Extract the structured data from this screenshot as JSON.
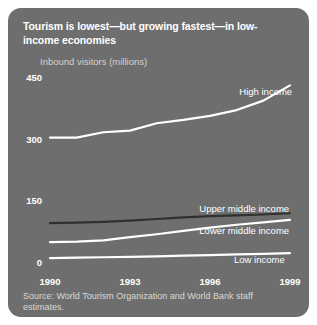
{
  "figure": {
    "title": "Tourism is lowest—but growing fastest—in low-income economies",
    "source": "Source: World Tourism Organization and World Bank staff estimates.",
    "panel_color": "#6e6e6e",
    "page_color": "#ffffff"
  },
  "chart_data": {
    "type": "line",
    "title": "Tourism is lowest—but growing fastest—in low-income economies",
    "subtitle": "",
    "xlabel": "",
    "ylabel": "Inbound visitors (millions)",
    "x": [
      1990,
      1991,
      1992,
      1993,
      1994,
      1995,
      1996,
      1997,
      1998,
      1999
    ],
    "xlim": [
      1990,
      1999
    ],
    "ylim": [
      0,
      450
    ],
    "xticks": [
      "1990",
      "1993",
      "1996",
      "1999"
    ],
    "xtick_values": [
      1990,
      1993,
      1996,
      1999
    ],
    "yticks": [
      "0",
      "150",
      "300",
      "450"
    ],
    "ytick_values": [
      0,
      150,
      300,
      450
    ],
    "grid": false,
    "legend": "inline-right",
    "series": [
      {
        "name": "High income",
        "color": "#ffffff",
        "width": 2.2,
        "label_x": 1997.1,
        "label_y": 415,
        "values": [
          305,
          305,
          318,
          322,
          340,
          348,
          358,
          372,
          395,
          432
        ]
      },
      {
        "name": "Upper middle income",
        "color": "#303030",
        "width": 2.2,
        "label_x": 1995.6,
        "label_y": 132,
        "values": [
          97,
          98,
          100,
          103,
          107,
          111,
          114,
          116,
          118,
          121
        ]
      },
      {
        "name": "Lower middle income",
        "color": "#ffffff",
        "width": 2.2,
        "label_x": 1995.6,
        "label_y": 79,
        "values": [
          51,
          52,
          55,
          63,
          70,
          78,
          86,
          93,
          99,
          105
        ]
      },
      {
        "name": "Low income",
        "color": "#ffffff",
        "width": 2.2,
        "label_x": 1996.9,
        "label_y": 8,
        "values": [
          12,
          13,
          14,
          15,
          16,
          18,
          19,
          21,
          22,
          24
        ]
      }
    ]
  }
}
